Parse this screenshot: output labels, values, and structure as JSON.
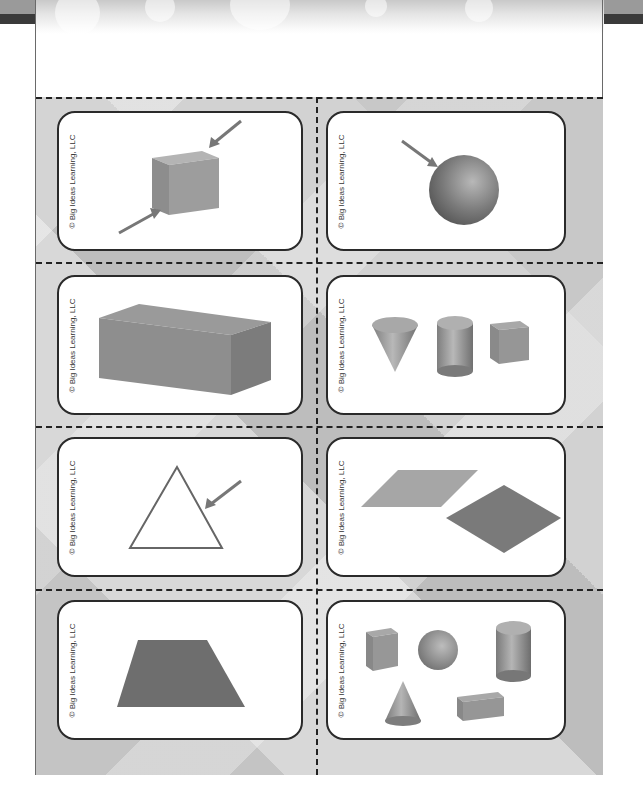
{
  "page": {
    "colors": {
      "card_border": "#2a2a2a",
      "cut_line": "#222222",
      "shape_gray": "#8c8c8c",
      "shape_dark": "#6e6e6e"
    }
  },
  "cards": [
    {
      "id": 1,
      "copyright": "© Big Ideas Learning, LLC",
      "image": "cube with two arrows pointing to vertices",
      "icon": "cube-vertex-icon"
    },
    {
      "id": 2,
      "copyright": "© Big Ideas Learning, LLC",
      "image": "sphere with arrow pointing to surface",
      "icon": "sphere-surface-icon"
    },
    {
      "id": 3,
      "copyright": "© Big Ideas Learning, LLC",
      "image": "rectangular prism",
      "icon": "rectangular-prism-icon"
    },
    {
      "id": 4,
      "copyright": "© Big Ideas Learning, LLC",
      "image": "cone, cylinder and cube",
      "icon": "three-solids-icon"
    },
    {
      "id": 5,
      "copyright": "© Big Ideas Learning, LLC",
      "image": "triangle outline with arrow pointing to side",
      "icon": "triangle-side-icon"
    },
    {
      "id": 6,
      "copyright": "© Big Ideas Learning, LLC",
      "image": "two rhombi",
      "icon": "rhombus-pair-icon"
    },
    {
      "id": 7,
      "copyright": "© Big Ideas Learning, LLC",
      "image": "trapezoid",
      "icon": "trapezoid-icon"
    },
    {
      "id": 8,
      "copyright": "© Big Ideas Learning, LLC",
      "image": "cube, sphere, cylinder, cone and rectangular prism",
      "icon": "five-solids-icon"
    }
  ]
}
